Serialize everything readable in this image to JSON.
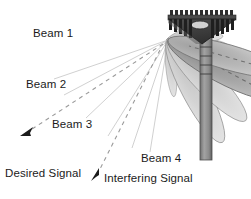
{
  "figure": {
    "background_color": "#ffffff",
    "width": 251,
    "height": 199
  },
  "labels": {
    "beam_1": "Beam 1",
    "beam_2": "Beam 2",
    "beam_3": "Beam 3",
    "beam_4": "Beam 4",
    "desired_signal_line_1": "Desired Signal",
    "desired_signal_line_2": "Direction",
    "interfering_signal": "Interfering Signal"
  },
  "colors": {
    "text": "#1b1b1b",
    "beam_dark_fill": "#9d9d9d",
    "beam_mid_fill": "#b4b4b4",
    "beam_light_fill": "#cfcfcf",
    "beam_stroke": "#6f6f6f",
    "antenna_plate_dark": "#3a3a3a",
    "antenna_plate_mid": "#555555",
    "antenna_rod": "#2e2e2e",
    "mast_fill": "#8d8d8d",
    "mast_stroke": "#4a4a4a",
    "dashed_line": "#9a9a9a",
    "arrow_head": "#1b1b1b"
  },
  "antenna": {
    "element_name": "triangular-phased-array",
    "rod_count_front": 13,
    "has_center_oval": true,
    "mast_band_count": 4
  },
  "beams": [
    {
      "name": "beam-1",
      "angle_deg": 196,
      "length": 120,
      "shade": "mid",
      "has_dashed_axis": true
    },
    {
      "name": "beam-2",
      "angle_deg": 208,
      "length": 118,
      "shade": "dark",
      "has_dashed_axis": true
    },
    {
      "name": "beam-3",
      "angle_deg": 226,
      "length": 105,
      "shade": "light",
      "has_dashed_axis": false
    },
    {
      "name": "beam-4",
      "angle_deg": 242,
      "length": 108,
      "shade": "light",
      "has_dashed_axis": false
    }
  ],
  "signal_paths": [
    {
      "name": "desired-signal-direction",
      "style": "dashed",
      "arrow_at": "upper-left",
      "from": [
        168,
        40
      ],
      "to": [
        26,
        133
      ]
    },
    {
      "name": "interfering-signal",
      "style": "dashed",
      "arrow_at": "lower-left",
      "from": [
        168,
        40
      ],
      "to": [
        95,
        177
      ]
    }
  ]
}
